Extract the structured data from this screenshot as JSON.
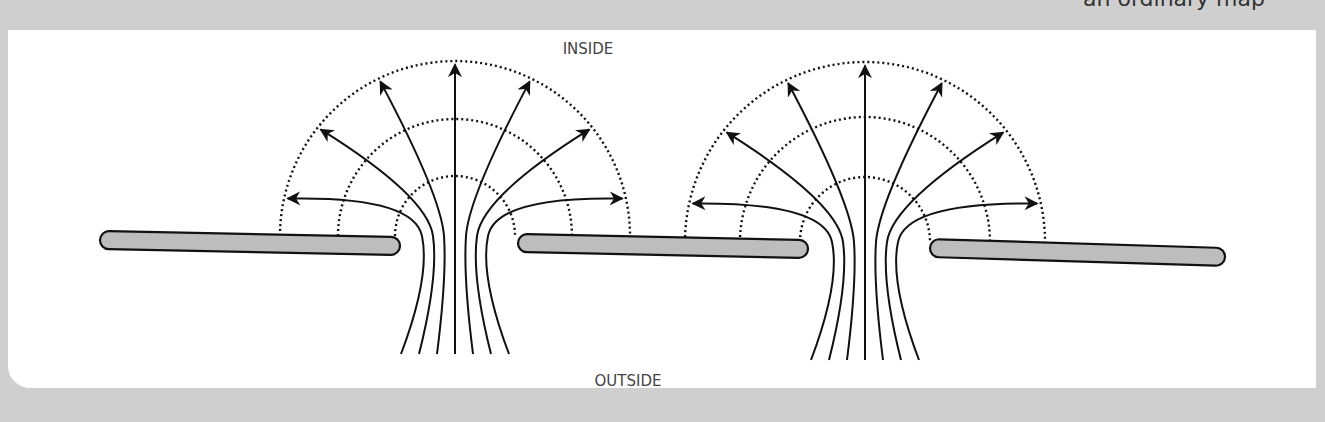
{
  "caption_fragment": "an ordinary map",
  "labels": {
    "top": "INSIDE",
    "bottom": "OUTSIDE"
  },
  "colors": {
    "background": "#cfcfcf",
    "panel": "#ffffff",
    "plate_fill": "#bdbdbd",
    "stroke": "#111111",
    "label": "#444444"
  },
  "plates": [
    {
      "x1": 100,
      "y1": 240,
      "x2": 400,
      "y2": 246
    },
    {
      "x1": 518,
      "y1": 243,
      "x2": 808,
      "y2": 249
    },
    {
      "x1": 930,
      "y1": 248,
      "x2": 1225,
      "y2": 257
    }
  ],
  "domes": [
    {
      "cx": 455,
      "cy": 236,
      "radii": [
        175,
        117,
        60
      ]
    },
    {
      "cx": 865,
      "cy": 242,
      "radii": [
        180,
        125,
        65
      ]
    }
  ],
  "field_lines_per_dome": 7
}
